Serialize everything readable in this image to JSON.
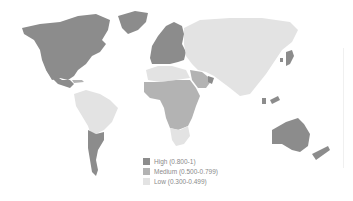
{
  "map": {
    "title": "",
    "colors": {
      "high": "#8c8c8c",
      "medium": "#b3b3b3",
      "low": "#e3e3e3",
      "background": "#ffffff"
    }
  },
  "legend": {
    "items": [
      {
        "label": "High (0.800-1)",
        "color": "#8c8c8c"
      },
      {
        "label": "Medium (0.500-0.799)",
        "color": "#b3b3b3"
      },
      {
        "label": "Low (0.300-0.499)",
        "color": "#e3e3e3"
      }
    ]
  }
}
